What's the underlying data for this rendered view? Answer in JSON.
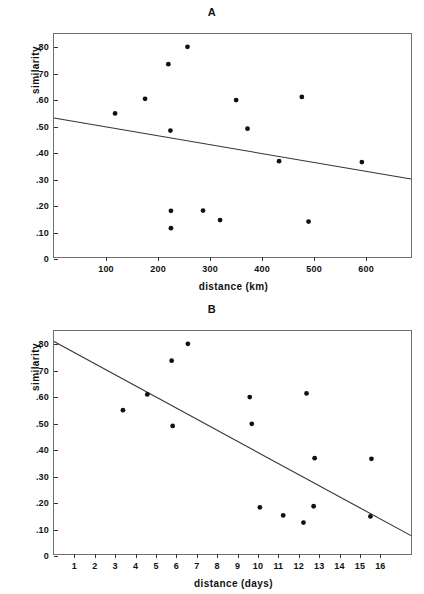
{
  "figure": {
    "background": "#ffffff",
    "ink_color": "#111111",
    "frame_color": "#6e6e6e"
  },
  "chart_data": [
    {
      "type": "scatter",
      "title": "A",
      "xlabel": "distance (km)",
      "ylabel": "similarity",
      "xlim": [
        0,
        690
      ],
      "ylim": [
        0,
        0.85
      ],
      "grid": false,
      "legend": null,
      "xticks": [
        100,
        200,
        300,
        400,
        500,
        600
      ],
      "xtick_labels": [
        "100",
        "200",
        "300",
        "400",
        "500",
        "600"
      ],
      "yticks": [
        0,
        0.1,
        0.2,
        0.3,
        0.4,
        0.5,
        0.6,
        0.7,
        0.8
      ],
      "ytick_labels": [
        "0",
        ".10",
        ".20",
        ".30",
        ".40",
        ".50",
        ".60",
        ".70",
        ".80"
      ],
      "points": [
        {
          "x": 118,
          "y": 0.547
        },
        {
          "x": 176,
          "y": 0.603
        },
        {
          "x": 221,
          "y": 0.735
        },
        {
          "x": 225,
          "y": 0.482
        },
        {
          "x": 226,
          "y": 0.176
        },
        {
          "x": 226,
          "y": 0.11
        },
        {
          "x": 258,
          "y": 0.801
        },
        {
          "x": 288,
          "y": 0.177
        },
        {
          "x": 321,
          "y": 0.141
        },
        {
          "x": 352,
          "y": 0.598
        },
        {
          "x": 374,
          "y": 0.489
        },
        {
          "x": 435,
          "y": 0.365
        },
        {
          "x": 479,
          "y": 0.61
        },
        {
          "x": 492,
          "y": 0.135
        },
        {
          "x": 595,
          "y": 0.362
        }
      ],
      "fit_line": {
        "x0": 0,
        "y0": 0.53,
        "x1": 690,
        "y1": 0.297
      }
    },
    {
      "type": "scatter",
      "title": "B",
      "xlabel": "distance (days)",
      "ylabel": "similarity",
      "xlim": [
        0,
        17.6
      ],
      "ylim": [
        0,
        0.85
      ],
      "grid": false,
      "legend": null,
      "xticks": [
        1,
        2,
        3,
        4,
        5,
        6,
        7,
        8,
        9,
        10,
        11,
        12,
        13,
        14,
        15,
        16
      ],
      "xtick_labels": [
        "1",
        "2",
        "3",
        "4",
        "5",
        "6",
        "7",
        "8",
        "9",
        "10",
        "11",
        "12",
        "13",
        "14",
        "15",
        "16"
      ],
      "yticks": [
        0,
        0.1,
        0.2,
        0.3,
        0.4,
        0.5,
        0.6,
        0.7,
        0.8
      ],
      "ytick_labels": [
        "0",
        ".10",
        ".20",
        ".30",
        ".40",
        ".50",
        ".60",
        ".70",
        ".80"
      ],
      "points": [
        {
          "x": 3.4,
          "y": 0.548
        },
        {
          "x": 4.6,
          "y": 0.608
        },
        {
          "x": 5.8,
          "y": 0.737
        },
        {
          "x": 5.85,
          "y": 0.488
        },
        {
          "x": 6.6,
          "y": 0.801
        },
        {
          "x": 9.65,
          "y": 0.598
        },
        {
          "x": 9.75,
          "y": 0.496
        },
        {
          "x": 10.15,
          "y": 0.178
        },
        {
          "x": 11.3,
          "y": 0.147
        },
        {
          "x": 12.3,
          "y": 0.12
        },
        {
          "x": 12.45,
          "y": 0.612
        },
        {
          "x": 12.8,
          "y": 0.182
        },
        {
          "x": 12.85,
          "y": 0.365
        },
        {
          "x": 15.6,
          "y": 0.143
        },
        {
          "x": 15.65,
          "y": 0.363
        }
      ],
      "fit_line": {
        "x0": 0,
        "y0": 0.81,
        "x1": 17.6,
        "y1": 0.07
      }
    }
  ]
}
